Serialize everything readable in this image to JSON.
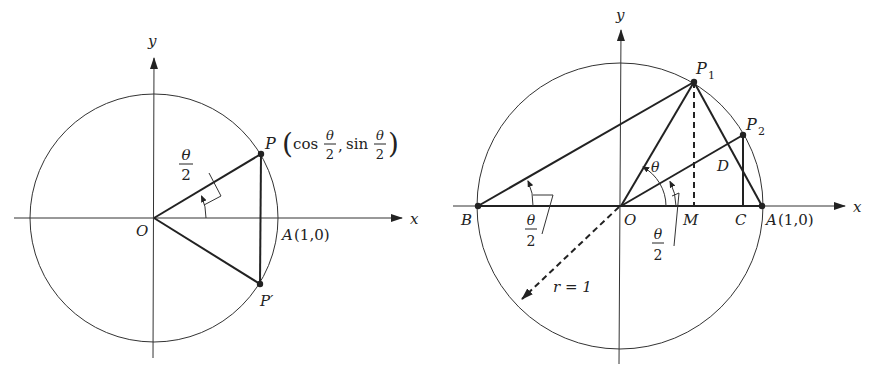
{
  "figure_left": {
    "title": "Unit circle with point P at half angle",
    "axis_x_label": "x",
    "axis_y_label": "y",
    "origin_label": "O",
    "point_P_label": "P",
    "point_P_coords_prefix": "(cos",
    "point_P_coords_sep": ", sin",
    "point_P_coords_suffix": ")",
    "point_P_prime_label": "P′",
    "point_A_label": "A",
    "point_A_coords": "(1,0)",
    "angle_numerator": "θ",
    "angle_denominator": "2",
    "frac_num": "θ",
    "frac_den": "2"
  },
  "figure_right": {
    "title": "Unit circle with chords and half-angle construction",
    "axis_x_label": "x",
    "axis_y_label": "y",
    "origin_label": "O",
    "point_P1_label": "P",
    "point_P1_sub": "1",
    "point_P2_label": "P",
    "point_P2_sub": "2",
    "point_A_label": "A",
    "point_A_coords": "(1,0)",
    "point_B_label": "B",
    "point_M_label": "M",
    "point_C_label": "C",
    "point_D_label": "D",
    "angle_theta_label": "θ",
    "angle_half_left_num": "θ",
    "angle_half_left_den": "2",
    "angle_half_right_num": "θ",
    "angle_half_right_den": "2",
    "radius_label": "r = 1"
  },
  "colors": {
    "stroke": "#222222",
    "background": "#ffffff"
  }
}
